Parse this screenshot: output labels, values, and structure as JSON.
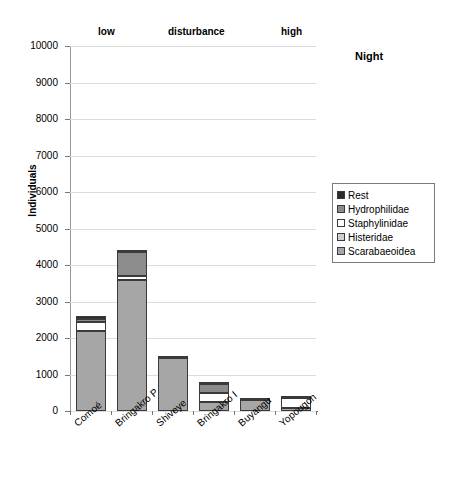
{
  "chart_data": {
    "type": "bar",
    "subtype": "stacked",
    "title": "",
    "annotation": "Night",
    "xlabel": "",
    "ylabel": "Individuals",
    "ylim": [
      0,
      10000
    ],
    "ytick_values": [
      0,
      1000,
      2000,
      3000,
      4000,
      5000,
      6000,
      7000,
      8000,
      9000,
      10000
    ],
    "ytick_labels": [
      "0",
      "1000",
      "2000",
      "3000",
      "4000",
      "5000",
      "6000",
      "7000",
      "8000",
      "9000",
      "10000"
    ],
    "grid": true,
    "legend_position": "right",
    "group_labels": [
      {
        "text": "low",
        "x_fraction": 0.13
      },
      {
        "text": "disturbance",
        "x_fraction": 0.42
      },
      {
        "text": "high",
        "x_fraction": 0.88
      }
    ],
    "categories": [
      "Comoé",
      "Bringakro P",
      "Shiveye",
      "Bringakro I",
      "Buyangu",
      "Yopougon"
    ],
    "series": [
      {
        "name": "Scarabaeoidea",
        "color": "#a6a6a6",
        "values": [
          2200,
          3600,
          1450,
          250,
          290,
          70
        ]
      },
      {
        "name": "Histeridae",
        "color": "#cfcfcf",
        "values": [
          0,
          0,
          0,
          0,
          0,
          0
        ]
      },
      {
        "name": "Staphylinidae",
        "color": "#ffffff",
        "values": [
          250,
          100,
          0,
          250,
          0,
          300
        ]
      },
      {
        "name": "Hydrophilidae",
        "color": "#8c8c8c",
        "values": [
          60,
          650,
          0,
          250,
          0,
          0
        ]
      },
      {
        "name": "Rest",
        "color": "#2b2b2b",
        "values": [
          90,
          50,
          60,
          50,
          60,
          30
        ]
      }
    ],
    "totals": [
      2600,
      4400,
      1510,
      800,
      350,
      400
    ]
  },
  "legend": {
    "items": [
      {
        "label": "Rest",
        "color": "#2b2b2b"
      },
      {
        "label": "Hydrophilidae",
        "color": "#8c8c8c"
      },
      {
        "label": "Staphylinidae",
        "color": "#ffffff"
      },
      {
        "label": "Histeridae",
        "color": "#cfcfcf"
      },
      {
        "label": "Scarabaeoidea",
        "color": "#a6a6a6"
      }
    ]
  },
  "colors": {
    "gridline": "#dcdcdc",
    "axis": "#777777",
    "bar_border": "#3a3a3a",
    "background": "#ffffff"
  }
}
